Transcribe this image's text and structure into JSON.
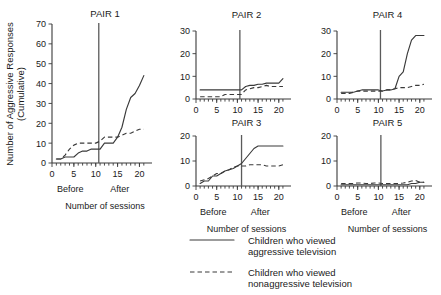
{
  "figure": {
    "ylabel_line1": "Number of Aggressive Responses",
    "ylabel_line2": "(Cumulative)",
    "xlabel": "Number of sessions",
    "phase_before": "Before",
    "phase_after": "After"
  },
  "legend": {
    "items": [
      {
        "style": "solid",
        "line1": "Children who viewed",
        "line2": "aggressive television"
      },
      {
        "style": "dashed",
        "line1": "Children who viewed",
        "line2": "nonaggressive television"
      }
    ]
  },
  "chart_data": [
    {
      "type": "line",
      "title": "PAIR 1",
      "xlabel": "Number of sessions",
      "ylabel": "Number of Aggressive Responses (Cumulative)",
      "xlim": [
        0,
        21.5
      ],
      "ylim": [
        0,
        70
      ],
      "xticks": [
        0,
        5,
        10,
        15,
        20
      ],
      "yticks": [
        0,
        10,
        20,
        30,
        40,
        50,
        60,
        70
      ],
      "grid": false,
      "phase_line_x": 10.7,
      "annotations": [
        "Before",
        "After"
      ],
      "x": [
        1,
        2,
        3,
        4,
        5,
        6,
        7,
        8,
        9,
        10,
        11,
        12,
        13,
        14,
        15,
        16,
        17,
        18,
        19,
        20,
        21
      ],
      "series": [
        {
          "name": "Children who viewed aggressive television",
          "style": "solid",
          "values": [
            2,
            2,
            3,
            3,
            3,
            5,
            6,
            6,
            7,
            7,
            7,
            10,
            10,
            10,
            13,
            18,
            27,
            33,
            35,
            39,
            44
          ]
        },
        {
          "name": "Children who viewed nonaggressive television",
          "style": "dashed",
          "values": [
            2,
            2,
            4,
            7,
            9,
            10,
            10,
            10,
            10,
            10,
            11,
            13,
            13,
            13,
            13,
            14,
            15,
            15,
            16,
            17,
            17
          ]
        }
      ]
    },
    {
      "type": "line",
      "title": "PAIR 2",
      "xlabel": "Number of sessions",
      "xlim": [
        0,
        21.5
      ],
      "ylim": [
        0,
        30
      ],
      "xticks": [
        0,
        5,
        10,
        15,
        20
      ],
      "yticks": [
        0,
        10,
        20,
        30
      ],
      "grid": false,
      "phase_line_x": 10.6,
      "x": [
        1,
        2,
        3,
        4,
        5,
        6,
        7,
        8,
        9,
        10,
        11,
        12,
        13,
        14,
        15,
        16,
        17,
        18,
        19,
        20,
        21
      ],
      "series": [
        {
          "name": "Children who viewed aggressive television",
          "style": "solid",
          "values": [
            4,
            4,
            4,
            4,
            4,
            4,
            4,
            4,
            4,
            4,
            4,
            5.5,
            6,
            6,
            6.5,
            6.5,
            7,
            7,
            7,
            7,
            9
          ]
        },
        {
          "name": "Children who viewed nonaggressive television",
          "style": "dashed",
          "values": [
            1,
            1,
            1,
            1,
            1,
            1,
            2,
            2,
            2,
            2,
            2,
            4,
            4.5,
            5,
            5,
            5.5,
            6,
            5.5,
            5.5,
            5.5,
            5.5
          ]
        }
      ]
    },
    {
      "type": "line",
      "title": "PAIR 3",
      "xlabel": "Number of sessions",
      "xlim": [
        0,
        21.5
      ],
      "ylim": [
        0,
        20
      ],
      "xticks": [
        0,
        5,
        10,
        15,
        20
      ],
      "yticks": [
        0,
        10,
        20
      ],
      "grid": false,
      "phase_line_x": 11.0,
      "annotations": [
        "Before",
        "After"
      ],
      "x": [
        1,
        2,
        3,
        4,
        5,
        6,
        7,
        8,
        9,
        10,
        11,
        12,
        13,
        14,
        15,
        16,
        17,
        18,
        19,
        20,
        21
      ],
      "series": [
        {
          "name": "Children who viewed aggressive television",
          "style": "solid",
          "values": [
            1,
            2,
            2,
            4,
            4,
            5,
            6,
            6.5,
            7,
            8,
            9,
            11,
            13,
            15,
            16,
            16,
            16,
            16,
            16,
            16,
            16
          ]
        },
        {
          "name": "Children who viewed nonaggressive television",
          "style": "dashed",
          "values": [
            2,
            2.5,
            3,
            4,
            5,
            5,
            6,
            6.5,
            7.5,
            8,
            8,
            8,
            8.5,
            8.5,
            8.5,
            8.5,
            8,
            8,
            8,
            8,
            8.5
          ]
        }
      ]
    },
    {
      "type": "line",
      "title": "PAIR 4",
      "xlabel": "Number of sessions",
      "xlim": [
        0,
        21.5
      ],
      "ylim": [
        0,
        30
      ],
      "xticks": [
        0,
        5,
        10,
        15,
        20
      ],
      "yticks": [
        0,
        10,
        20,
        30
      ],
      "grid": false,
      "phase_line_x": 10.5,
      "x": [
        1,
        2,
        3,
        4,
        5,
        6,
        7,
        8,
        9,
        10,
        11,
        12,
        13,
        14,
        15,
        16,
        17,
        18,
        19,
        20,
        21
      ],
      "series": [
        {
          "name": "Children who viewed aggressive television",
          "style": "solid",
          "values": [
            3,
            3,
            3,
            3,
            3.5,
            4,
            4,
            4,
            4,
            4,
            3.5,
            4,
            4,
            4.5,
            10,
            12,
            20,
            26,
            28,
            28,
            28
          ]
        },
        {
          "name": "Children who viewed nonaggressive television",
          "style": "dashed",
          "values": [
            2.5,
            2.5,
            2.5,
            3,
            3.5,
            3.5,
            3.5,
            3.5,
            3.5,
            3.5,
            3.5,
            4,
            4,
            4.5,
            5,
            5,
            5,
            5.5,
            6,
            6,
            6.5
          ]
        }
      ]
    },
    {
      "type": "line",
      "title": "PAIR 5",
      "xlabel": "Number of sessions",
      "xlim": [
        0,
        21.5
      ],
      "ylim": [
        0,
        20
      ],
      "xticks": [
        0,
        5,
        10,
        15,
        20
      ],
      "yticks": [
        0,
        10,
        20
      ],
      "grid": false,
      "phase_line_x": 10.6,
      "annotations": [
        "Before",
        "After"
      ],
      "x": [
        1,
        2,
        3,
        4,
        5,
        6,
        7,
        8,
        9,
        10,
        11,
        12,
        13,
        14,
        15,
        16,
        17,
        18,
        19,
        20,
        21
      ],
      "series": [
        {
          "name": "Children who viewed aggressive television",
          "style": "solid",
          "values": [
            0.5,
            0.5,
            0.5,
            0.5,
            0.5,
            0.5,
            0.5,
            0.5,
            0.5,
            0.5,
            0.5,
            0.5,
            0.5,
            0.5,
            0.5,
            0.5,
            0.5,
            1,
            1,
            1.5,
            1.5
          ]
        },
        {
          "name": "Children who viewed nonaggressive television",
          "style": "dashed",
          "values": [
            1,
            1,
            1,
            1,
            1.2,
            1.2,
            1,
            1,
            1.2,
            1.2,
            1,
            1,
            1,
            1,
            1,
            1.2,
            1.5,
            2,
            2.2,
            1.5,
            1.5
          ]
        }
      ]
    }
  ]
}
